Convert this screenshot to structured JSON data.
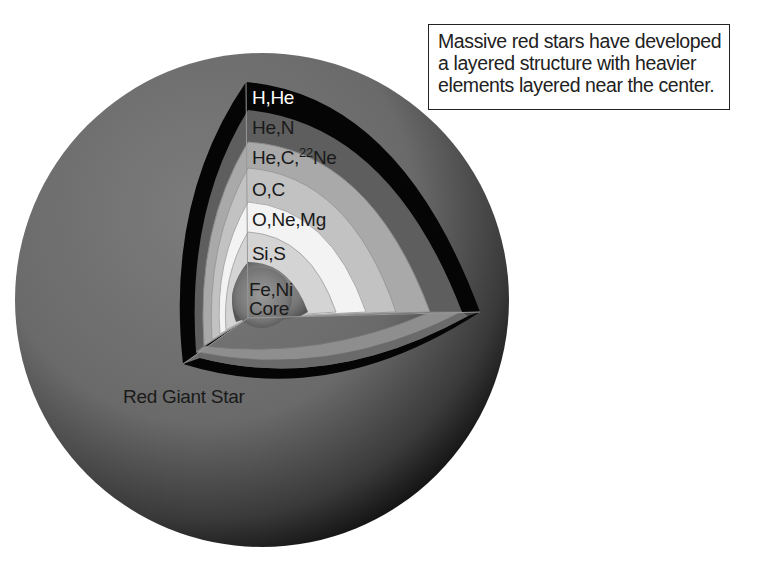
{
  "caption": {
    "lines": [
      "Massive red stars have developed",
      "a layered structure with heavier",
      "elements layered near the center."
    ]
  },
  "star": {
    "label": "Red Giant Star",
    "color": "#6e6e6e"
  },
  "layers": [
    {
      "label": "H,He",
      "color": "#050505",
      "text_color": "#ffffff"
    },
    {
      "label": "He,N",
      "color": "#5a5a5a",
      "text_color": "#1a1a1a"
    },
    {
      "label_pre": "He,C,",
      "label_sup": "22",
      "label_post": "Ne",
      "label": "He,C,22Ne",
      "color": "#a8a8a8",
      "text_color": "#1a1a1a"
    },
    {
      "label": "O,C",
      "color": "#c4c4c4",
      "text_color": "#1a1a1a"
    },
    {
      "label": "O,Ne,Mg",
      "color": "#f2f2f2",
      "text_color": "#1a1a1a"
    },
    {
      "label": "Si,S",
      "color": "#d6d6d6",
      "text_color": "#1a1a1a"
    },
    {
      "label": "Fe,Ni",
      "color": "#7a7a7a",
      "text_color": "#1a1a1a"
    },
    {
      "label": "Core",
      "color": "#7a7a7a",
      "text_color": "#1a1a1a"
    }
  ]
}
